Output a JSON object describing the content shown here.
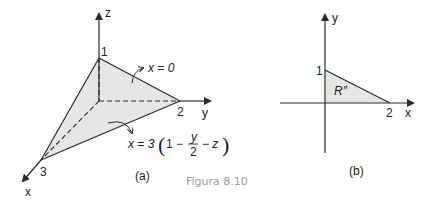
{
  "figure": {
    "caption": "Figura 8.10",
    "panel_a": {
      "label": "(a)",
      "axes": {
        "x": "x",
        "y": "y",
        "z": "z"
      },
      "intercepts": {
        "z": "1",
        "y": "2",
        "x": "3"
      },
      "annotations": {
        "plane_x0": "x = 0",
        "surface_prefix": "x = 3",
        "surface_one": "1 −",
        "surface_num": "y",
        "surface_den": "2",
        "surface_suffix": "− z"
      },
      "colors": {
        "fill": "#e6e6e6",
        "line": "#2a2a2a"
      }
    },
    "panel_b": {
      "label": "(b)",
      "axes": {
        "x": "x",
        "y": "y"
      },
      "intercepts": {
        "y": "1",
        "x": "2"
      },
      "region_label": "R″",
      "colors": {
        "fill": "#e6e6e6",
        "line": "#2a2a2a"
      }
    }
  }
}
